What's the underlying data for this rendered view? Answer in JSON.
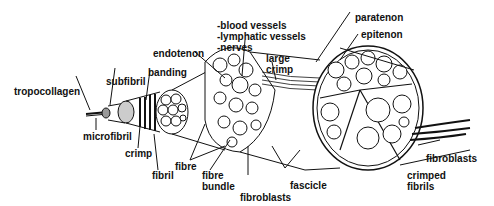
{
  "diagram": {
    "labels": {
      "tropocollagen": "tropocollagen",
      "subfibril": "subfibril",
      "banding": "banding",
      "microfibril": "microfibril",
      "crimp": "crimp",
      "fibril": "fibril",
      "fibre": "fibre",
      "fibre_bundle_1": "fibre",
      "fibre_bundle_2": "bundle",
      "endotenon": "endotenon",
      "vessels_1": "-blood vessels",
      "vessels_2": "-lymphatic vessels",
      "vessels_3": "-nerves",
      "large_crimp_1": "large",
      "large_crimp_2": "crimp",
      "fibroblasts_center": "fibroblasts",
      "fascicle": "fascicle",
      "paratenon": "paratenon",
      "epitenon": "epitenon",
      "fibroblasts_right": "fibroblasts",
      "crimped_fibrils_1": "crimped",
      "crimped_fibrils_2": "fibrils"
    }
  }
}
